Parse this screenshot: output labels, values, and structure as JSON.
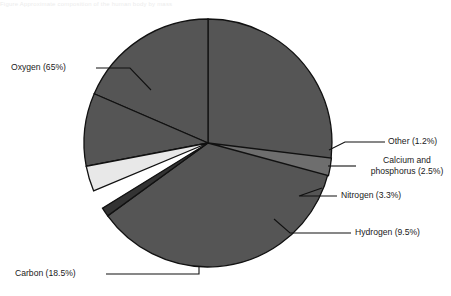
{
  "header": {
    "caption": "Figure   Approximate composition of the human body by mass"
  },
  "chart_data": {
    "type": "pie",
    "title": "",
    "xlabel": "",
    "ylabel": "",
    "legend_position": "none",
    "grid": false,
    "unit": "percent",
    "start_angle_deg": 0,
    "direction": "clockwise",
    "categories": [
      "Oxygen",
      "Other",
      "Calcium and phosphorus",
      "Nitrogen",
      "Hydrogen",
      "Carbon"
    ],
    "values": [
      65,
      1.2,
      2.5,
      3.3,
      9.5,
      18.5
    ],
    "slices": [
      {
        "name": "Oxygen",
        "value": 65,
        "label": "Oxygen (65%)",
        "color": "#555555",
        "label_side": "left"
      },
      {
        "name": "Other",
        "value": 1.2,
        "label": "Other (1.2%)",
        "color": "#333333",
        "label_side": "right"
      },
      {
        "name": "Calcium and phosphorus",
        "value": 2.5,
        "label": "Calcium and phosphorus (2.5%)",
        "label_line1": "Calcium and",
        "label_line2": "phosphorus (2.5%)",
        "color": "#6e6e6e",
        "label_side": "right"
      },
      {
        "name": "Nitrogen",
        "value": 3.3,
        "label": "Nitrogen (3.3%)",
        "color": "#e8e8e8",
        "label_side": "right"
      },
      {
        "name": "Hydrogen",
        "value": 9.5,
        "label": "Hydrogen (9.5%)",
        "color": "#555555",
        "label_side": "right"
      },
      {
        "name": "Carbon",
        "value": 18.5,
        "label": "Carbon (18.5%)",
        "color": "#555555",
        "label_side": "left"
      }
    ],
    "colors": {
      "default_slice": "#555555",
      "other_slice": "#333333",
      "calcium_slice": "#6e6e6e",
      "nitrogen_slice": "#e8e8e8",
      "outline": "#111111",
      "leader_line": "#111111",
      "background": "#ffffff",
      "label_text": "#1a1a1a"
    }
  }
}
